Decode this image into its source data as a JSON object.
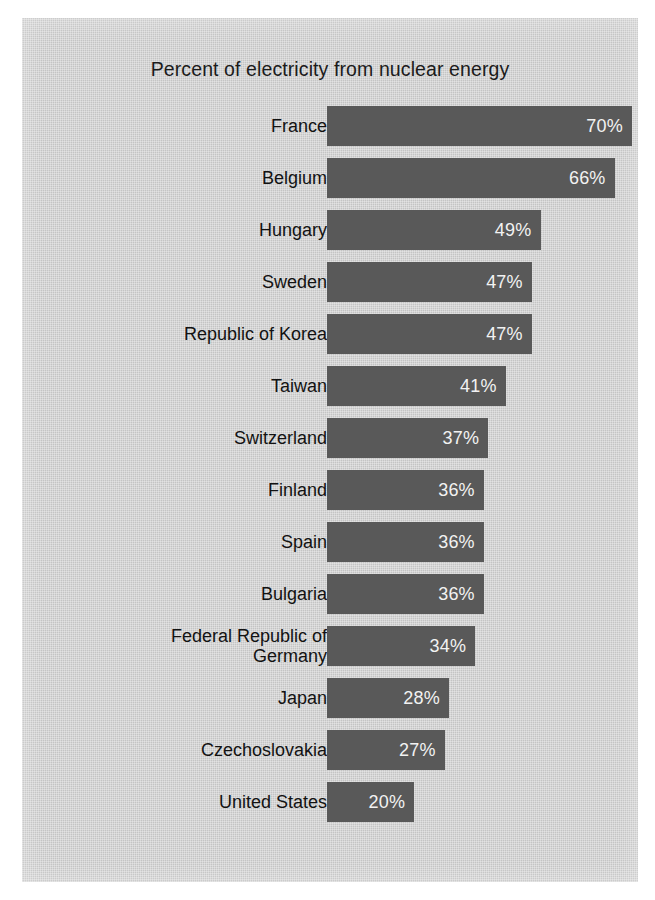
{
  "chart_data": {
    "type": "bar",
    "orientation": "horizontal",
    "title": "Percent of electricity from nuclear energy",
    "xlabel": "",
    "ylabel": "",
    "xlim": [
      0,
      70
    ],
    "grid": false,
    "legend": null,
    "bar_color": "#595959",
    "background_color": "#cbcbcb",
    "text_color": "#121212",
    "value_label_color": "#f2f2f2",
    "value_suffix": "%",
    "categories": [
      "France",
      "Belgium",
      "Hungary",
      "Sweden",
      "Republic of Korea",
      "Taiwan",
      "Switzerland",
      "Finland",
      "Spain",
      "Bulgaria",
      "Federal Republic of\nGermany",
      "Japan",
      "Czechoslovakia",
      "United States"
    ],
    "values": [
      70,
      66,
      49,
      47,
      47,
      41,
      37,
      36,
      36,
      36,
      34,
      28,
      27,
      20
    ],
    "value_labels": [
      "70%",
      "66%",
      "49%",
      "47%",
      "47%",
      "41%",
      "37%",
      "36%",
      "36%",
      "36%",
      "34%",
      "28%",
      "27%",
      "20%"
    ]
  }
}
